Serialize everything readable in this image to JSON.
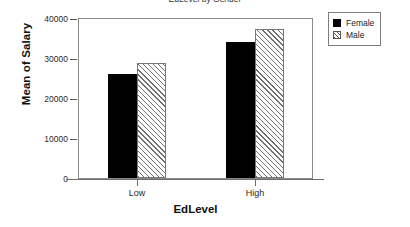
{
  "chart_data": {
    "type": "bar",
    "title": "EdLevel by Gender",
    "title_truncated": true,
    "xlabel": "EdLevel",
    "ylabel": "Mean of Salary",
    "categories": [
      "Low",
      "High"
    ],
    "series": [
      {
        "name": "Female",
        "values": [
          27400,
          35970
        ],
        "fill": "solid-black"
      },
      {
        "name": "Male",
        "values": [
          30300,
          39500
        ],
        "fill": "diagonal-hatch"
      }
    ],
    "ylim": [
      0,
      42000
    ],
    "yticks": [
      0,
      10000,
      20000,
      30000,
      40000
    ],
    "ytick_labels": [
      "0",
      "10000",
      "20000",
      "30000",
      "40000"
    ],
    "grid": false,
    "legend_position": "right-top",
    "legend_entries": [
      "Female",
      "Male"
    ],
    "colors": {
      "female": "#000000",
      "male_hatch": "#6e6e6e",
      "frame": "#8a8a8a",
      "axis": "#6d6d6d",
      "background": "#ffffff"
    }
  }
}
